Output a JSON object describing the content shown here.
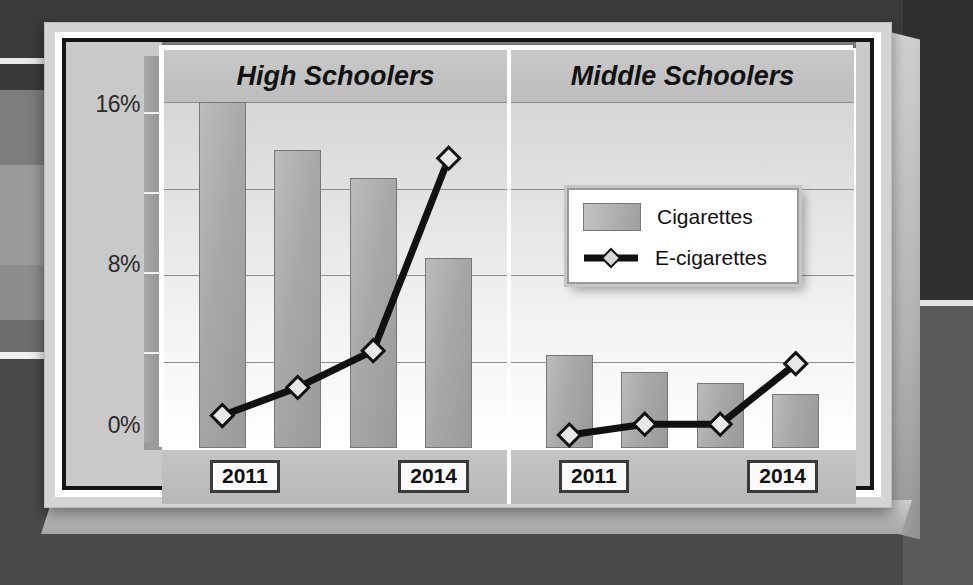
{
  "chart_data": {
    "type": "bar",
    "title": "",
    "xlabel": "",
    "ylabel": "",
    "ylim": [
      0,
      16
    ],
    "ytick_labels": [
      "0%",
      "8%",
      "16%"
    ],
    "ytick_values": [
      0,
      8,
      16
    ],
    "gridlines": [
      4,
      8,
      12,
      16
    ],
    "grid": true,
    "legend_position": "upper-right-over-middle-panel",
    "panels": [
      {
        "name": "High Schoolers",
        "categories": [
          "2011",
          "2012",
          "2013",
          "2014"
        ],
        "series": [
          {
            "name": "Cigarettes",
            "type": "bar",
            "values": [
              16.0,
              13.8,
              12.5,
              8.8
            ]
          },
          {
            "name": "E-cigarettes",
            "type": "line",
            "values": [
              1.5,
              2.8,
              4.5,
              13.4
            ]
          }
        ]
      },
      {
        "name": "Middle Schoolers",
        "categories": [
          "2011",
          "2012",
          "2013",
          "2014"
        ],
        "series": [
          {
            "name": "Cigarettes",
            "type": "bar",
            "values": [
              4.3,
              3.5,
              3.0,
              2.5
            ]
          },
          {
            "name": "E-cigarettes",
            "type": "line",
            "values": [
              0.6,
              1.1,
              1.1,
              3.9
            ]
          }
        ]
      }
    ]
  },
  "axis": {
    "y_top_label": "16%",
    "y_mid_label": "8%",
    "y_bottom_label": "0%"
  },
  "panel_titles": {
    "left": "High Schoolers",
    "right": "Middle Schoolers"
  },
  "legend": {
    "bar_label": "Cigarettes",
    "line_label": "E-cigarettes"
  },
  "xticks": {
    "left_panel_first": "2011",
    "left_panel_last": "2014",
    "right_panel_first": "2011",
    "right_panel_last": "2014"
  },
  "colors": {
    "bar_fill": "#a8a8a8",
    "bar_stroke": "#777777",
    "line": "#111111",
    "marker_fill": "#e8e8e8",
    "frame": "#d4d4d4",
    "inner_border": "#151515",
    "plot_bg": "#eeeeee"
  }
}
